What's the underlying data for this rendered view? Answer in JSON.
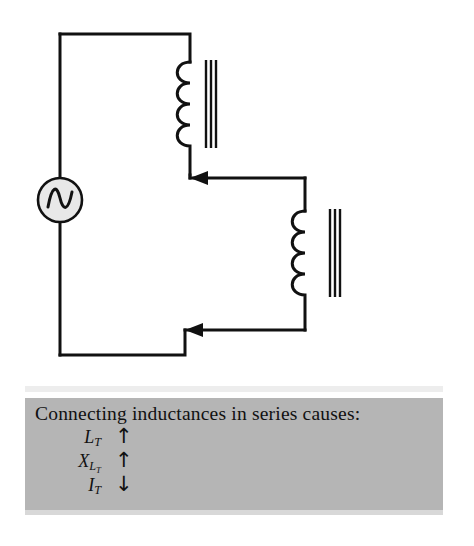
{
  "figure": {
    "kind": "electrical-schematic"
  },
  "circuit": {
    "source": {
      "name": "ac-voltage-source",
      "symbol": "sine-wave",
      "fill": "#e8e8e8",
      "stroke": "#111111"
    },
    "components": [
      {
        "name": "inductor-1",
        "type": "iron-core-inductor",
        "coils": 4,
        "core_lines": 3
      },
      {
        "name": "inductor-2",
        "type": "iron-core-inductor",
        "coils": 4,
        "core_lines": 3
      }
    ],
    "current_arrows": [
      {
        "name": "current-arrow-upper",
        "direction": "left"
      },
      {
        "name": "current-arrow-lower",
        "direction": "left"
      }
    ],
    "wire_color": "#111111",
    "wire_width": 3
  },
  "caption": {
    "background": "#b5b5b5",
    "title": "Connecting inductances in series causes:",
    "rows": [
      {
        "symbol_main": "L",
        "symbol_sub": "T",
        "symbol_subsub": "",
        "arrow": "↑",
        "arrow_meaning": "increase"
      },
      {
        "symbol_main": "X",
        "symbol_sub": "L",
        "symbol_subsub": "T",
        "arrow": "↑",
        "arrow_meaning": "increase"
      },
      {
        "symbol_main": "I",
        "symbol_sub": "T",
        "symbol_subsub": "",
        "arrow": "↓",
        "arrow_meaning": "decrease"
      }
    ]
  }
}
